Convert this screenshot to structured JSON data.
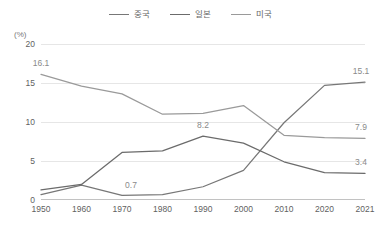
{
  "unit_label": "(%)",
  "legend": {
    "position": "top-center",
    "entries": [
      {
        "label": "중국",
        "color": "#777777"
      },
      {
        "label": "일본",
        "color": "#6b6b6b"
      },
      {
        "label": "미국",
        "color": "#9a9a9a"
      }
    ]
  },
  "axes": {
    "y_ticks": [
      "0",
      "5",
      "10",
      "15",
      "20"
    ],
    "x_ticks": [
      "1950",
      "1960",
      "1970",
      "1980",
      "1990",
      "2000",
      "2010",
      "2020",
      "2021"
    ]
  },
  "annotations": [
    {
      "text": "16.1",
      "x_index": 0,
      "value": 16.1,
      "series": "미국",
      "dx": 0,
      "dy": -11
    },
    {
      "text": "0.7",
      "x_index": 2,
      "value": 0.7,
      "series": "중국",
      "dx": 9,
      "dy": -10
    },
    {
      "text": "8.2",
      "x_index": 4,
      "value": 8.2,
      "series": "일본",
      "dx": 0,
      "dy": -11
    },
    {
      "text": "15.1",
      "x_index": 8,
      "value": 15.1,
      "series": "중국",
      "dx": -4,
      "dy": -11
    },
    {
      "text": "7.9",
      "x_index": 8,
      "value": 7.9,
      "series": "미국",
      "dx": -4,
      "dy": -11
    },
    {
      "text": "3.4",
      "x_index": 8,
      "value": 3.4,
      "series": "중국",
      "dx": -4,
      "dy": -11
    }
  ],
  "chart_data": {
    "type": "line",
    "title": "",
    "xlabel": "",
    "ylabel": "(%)",
    "categories": [
      "1950",
      "1960",
      "1970",
      "1980",
      "1990",
      "2000",
      "2010",
      "2020",
      "2021"
    ],
    "ylim": [
      0,
      20
    ],
    "ytick_step": 5,
    "grid": true,
    "legend_position": "top-center",
    "series": [
      {
        "name": "중국",
        "color": "#777777",
        "values": [
          0.7,
          1.9,
          0.6,
          0.7,
          1.7,
          3.8,
          9.9,
          14.7,
          15.1
        ]
      },
      {
        "name": "일본",
        "color": "#6b6b6b",
        "values": [
          1.3,
          2.0,
          6.1,
          6.3,
          8.2,
          7.3,
          4.9,
          3.5,
          3.4
        ]
      },
      {
        "name": "미국",
        "color": "#9a9a9a",
        "values": [
          16.1,
          14.6,
          13.6,
          11.0,
          11.1,
          12.1,
          8.3,
          8.0,
          7.9
        ]
      }
    ]
  }
}
